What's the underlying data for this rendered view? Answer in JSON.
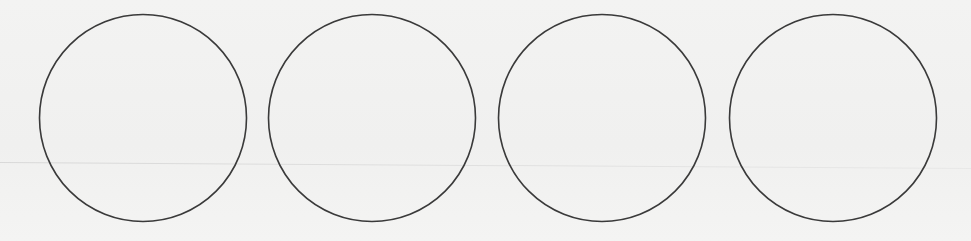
{
  "diagram": {
    "title": "",
    "shape_type": "circle",
    "circle_count": 4,
    "stroke_color": "#3a3a3a",
    "fill_color": "none",
    "background_color": "#f1f1f0",
    "labels": []
  }
}
